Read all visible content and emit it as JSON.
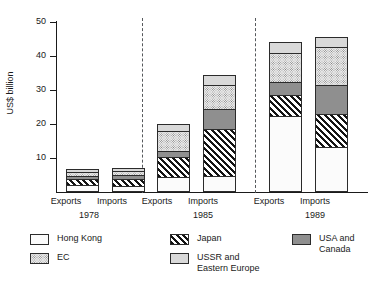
{
  "chart_data": {
    "type": "bar",
    "subtype": "stacked-bar",
    "title": "",
    "xlabel": "",
    "ylabel": "US$ billion",
    "ylim": [
      0,
      50
    ],
    "yticks": [
      0,
      10,
      20,
      30,
      40,
      50
    ],
    "grid": false,
    "legend_position": "bottom",
    "categories": [
      "1978 Exports",
      "1978 Imports",
      "1985 Exports",
      "1985 Imports",
      "1989 Exports",
      "1989 Imports"
    ],
    "groups": [
      {
        "year": "1978",
        "bars": [
          "Exports",
          "Imports"
        ]
      },
      {
        "year": "1985",
        "bars": [
          "Exports",
          "Imports"
        ]
      },
      {
        "year": "1989",
        "bars": [
          "Exports",
          "Imports"
        ]
      }
    ],
    "series": [
      {
        "name": "Hong Kong",
        "pattern": "light-dots",
        "values": [
          2.0,
          1.6,
          4.3,
          4.5,
          22.3,
          13.2
        ]
      },
      {
        "name": "Japan",
        "pattern": "diagonal-hatch",
        "values": [
          1.8,
          2.3,
          6.0,
          14.0,
          6.2,
          9.6
        ]
      },
      {
        "name": "USA and Canada",
        "pattern": "dark-gray",
        "values": [
          1.1,
          1.3,
          1.7,
          6.1,
          4.1,
          8.8
        ]
      },
      {
        "name": "EC",
        "pattern": "dense-dots",
        "values": [
          1.2,
          1.1,
          6.2,
          7.2,
          8.4,
          11.4
        ]
      },
      {
        "name": "USSR and Eastern Europe",
        "pattern": "light-gray",
        "values": [
          0.8,
          0.7,
          1.8,
          2.7,
          3.0,
          2.5
        ]
      }
    ],
    "totals": [
      6.9,
      7.0,
      20.0,
      34.5,
      44.0,
      45.5
    ]
  },
  "axis": {
    "y_title": "US$ billion",
    "y_tick_labels": [
      "50",
      "40",
      "30",
      "20",
      "10"
    ]
  },
  "x_axis": {
    "bar_labels": [
      "Exports",
      "Imports",
      "Exports",
      "Imports",
      "Exports",
      "Imports"
    ],
    "group_labels": [
      "1978",
      "1985",
      "1989"
    ]
  },
  "legend": {
    "column_1": [
      {
        "label": "Hong Kong",
        "pattern": "light-dots"
      },
      {
        "label": "EC",
        "pattern": "dense-dots"
      }
    ],
    "column_2": [
      {
        "label": "Japan",
        "pattern": "diagonal-hatch"
      },
      {
        "label": "USSR and\nEastern Europe",
        "pattern": "light-gray"
      }
    ],
    "column_3": [
      {
        "label": "USA and\nCanada",
        "pattern": "dark-gray"
      }
    ]
  },
  "colors": {
    "axis": "#1a1a1a",
    "bar_outline": "#2b2b2b",
    "separator": "#55585c",
    "usa_canada_fill": "#8f8f8f",
    "ussr_fill": "#d9d9d9",
    "background": "#ffffff"
  }
}
